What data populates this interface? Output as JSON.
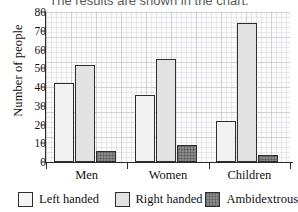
{
  "caption": "The results are shown in the chart.",
  "chart_data": {
    "type": "bar",
    "title": "",
    "xlabel": "",
    "ylabel": "Number of people",
    "ylim": [
      0,
      80
    ],
    "ytick_step": 10,
    "yticks": [
      "0",
      "10",
      "20",
      "30",
      "40",
      "50",
      "60",
      "70",
      "80"
    ],
    "grid": true,
    "grid_style": "graph-paper",
    "legend_position": "bottom",
    "categories": [
      "Men",
      "Women",
      "Children"
    ],
    "series": [
      {
        "name": "Left handed",
        "color": "#f2f2f2",
        "values": [
          42,
          36,
          22
        ]
      },
      {
        "name": "Right handed",
        "color": "#e2e2e2",
        "values": [
          52,
          55,
          74
        ]
      },
      {
        "name": "Ambidextrous",
        "color": "#8a8a8a",
        "values": [
          6,
          9,
          4
        ]
      }
    ]
  },
  "legend": {
    "items": [
      {
        "label": "Left handed"
      },
      {
        "label": "Right handed"
      },
      {
        "label": "Ambidextrous"
      }
    ]
  }
}
